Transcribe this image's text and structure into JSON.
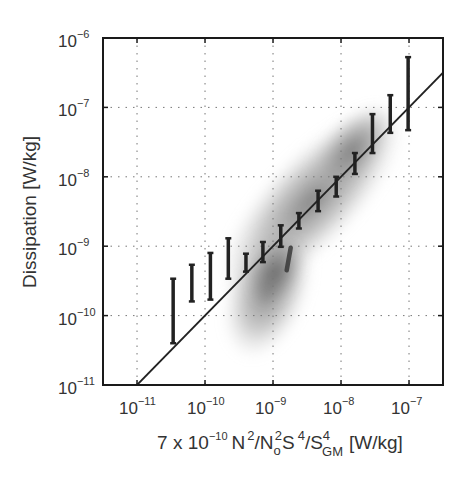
{
  "chart_data": {
    "type": "scatter",
    "title": "",
    "xlabel": "7 x 10^-10 N^2/No^2 S^4/S_GM^4 [W/kg]",
    "xlabel_parts": {
      "prefix": "7 x 10",
      "prefix_exp": "−10",
      "n": "N",
      "n_exp": "2",
      "slash1": "/N",
      "no_sub": "o",
      "no_exp": "2",
      "s": "S",
      "s_exp": "4",
      "slash2": "/S",
      "sgm_sub": "GM",
      "sgm_exp": "4",
      "units": "[W/kg]"
    },
    "ylabel": "Dissipation   [W/kg]",
    "xscale": "log",
    "yscale": "log",
    "xlim": [
      3.16e-12,
      3.16e-07
    ],
    "ylim": [
      1e-11,
      1e-06
    ],
    "grid": true,
    "x_ticks": [
      {
        "base": "10",
        "exp": "−11",
        "value": 1e-11
      },
      {
        "base": "10",
        "exp": "−10",
        "value": 1e-10
      },
      {
        "base": "10",
        "exp": "−9",
        "value": 1e-09
      },
      {
        "base": "10",
        "exp": "−8",
        "value": 1e-08
      },
      {
        "base": "10",
        "exp": "−7",
        "value": 1e-07
      }
    ],
    "y_ticks": [
      {
        "base": "10",
        "exp": "−6",
        "value": 1e-06
      },
      {
        "base": "10",
        "exp": "−7",
        "value": 1e-07
      },
      {
        "base": "10",
        "exp": "−8",
        "value": 1e-08
      },
      {
        "base": "10",
        "exp": "−9",
        "value": 1e-09
      },
      {
        "base": "10",
        "exp": "−10",
        "value": 1e-10
      },
      {
        "base": "10",
        "exp": "−11",
        "value": 1e-11
      }
    ],
    "series": [
      {
        "name": "binned range bars",
        "kind": "errorbar",
        "color": "#222222",
        "x": [
          3.4e-11,
          6.4e-11,
          1.2e-10,
          2.2e-10,
          4e-10,
          7.1e-10,
          1.3e-09,
          2.4e-09,
          4.6e-09,
          8.5e-09,
          1.6e-08,
          2.9e-08,
          5.3e-08,
          9.7e-08
        ],
        "ylow": [
          4e-11,
          1.6e-10,
          1.7e-10,
          3.4e-10,
          4.3e-10,
          5.9e-10,
          9.8e-10,
          1.8e-09,
          3.2e-09,
          5.2e-09,
          1.1e-08,
          2.2e-08,
          4.3e-08,
          4.7e-08
        ],
        "yhigh": [
          3.4e-10,
          5.4e-10,
          8e-10,
          1.3e-09,
          7.8e-10,
          1.15e-09,
          2e-09,
          3e-09,
          6.3e-09,
          1e-08,
          2.2e-08,
          8e-08,
          1.5e-07,
          5.3e-07
        ]
      },
      {
        "name": "1:1 line",
        "kind": "line",
        "color": "#222222",
        "x": [
          1e-11,
          3.16e-07
        ],
        "y": [
          1e-11,
          3.16e-07
        ]
      },
      {
        "name": "observation density",
        "kind": "density-cloud",
        "color": "#808080",
        "center": [
          1.3e-09,
          1.3e-09
        ],
        "description": "gray 2D histogram elongated along the 1:1 line from ~3e-10 to ~8e-8, darkest near x≈1e-9, y≈5e-10"
      },
      {
        "name": "dark streak",
        "kind": "errorbar",
        "color": "#333333",
        "x": [
          1.7e-09
        ],
        "ylow": [
          4.5e-10
        ],
        "yhigh": [
          9.5e-10
        ]
      }
    ]
  }
}
